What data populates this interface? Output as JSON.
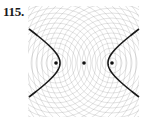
{
  "figure": {
    "number_label": "115.",
    "background_pattern": {
      "type": "concentric-circles",
      "centers": [
        [
          56,
          63
        ],
        [
          112,
          63
        ]
      ],
      "spacing": 5,
      "color": "#9a9a9a",
      "clip": {
        "x": 28,
        "y": 6,
        "width": 111,
        "height": 111
      }
    },
    "points": [
      {
        "name": "left-focus",
        "x": 56,
        "y": 63
      },
      {
        "name": "center",
        "x": 84,
        "y": 63
      },
      {
        "name": "right-focus",
        "x": 112,
        "y": 63
      }
    ],
    "hyperbola": {
      "center": [
        84,
        63
      ],
      "vertex_offset": 24,
      "left_branch": {
        "top": [
          29,
          29
        ],
        "vertex": [
          60,
          63
        ],
        "bottom": [
          29,
          97
        ]
      },
      "right_branch": {
        "top": [
          139,
          29
        ],
        "vertex": [
          108,
          63
        ],
        "bottom": [
          139,
          97
        ]
      },
      "color": "#1a1a1a"
    }
  }
}
